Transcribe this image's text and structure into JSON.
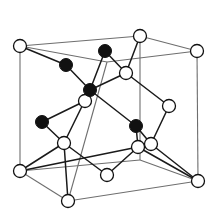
{
  "figure": {
    "background_color": "#ffffff",
    "width": 216,
    "height": 219
  },
  "style": {
    "cell_edge_color": "#6e6e6e",
    "cell_edge_width": 1.1,
    "bond_color": "#1a1a1a",
    "bond_width": 1.5,
    "open_atom_fill": "#ffffff",
    "open_atom_stroke": "#111111",
    "filled_atom_fill": "#111111",
    "open_atom_radius": 6.5,
    "filled_atom_radius": 6.5
  },
  "chart_data": {
    "type": "scatter",
    "xlabel": "",
    "ylabel": "",
    "grid": false,
    "legend": [
      {
        "marker": "open-circle",
        "label": "anion site"
      },
      {
        "marker": "filled-circle",
        "label": "cation site"
      }
    ],
    "cell_vertices": {
      "top_front_left": [
        20,
        46
      ],
      "top_back_left": [
        140,
        36
      ],
      "top_back_right": [
        197,
        51
      ],
      "top_front_right": [
        107,
        62
      ],
      "bottom_front_left": [
        20,
        171
      ],
      "bottom_back_left": [
        140,
        160
      ],
      "bottom_back_right": [
        198,
        181
      ],
      "bottom_front_right": [
        68,
        201
      ]
    },
    "cell_edges": [
      [
        "top_front_left",
        "top_back_left"
      ],
      [
        "top_back_left",
        "top_back_right"
      ],
      [
        "top_back_right",
        "top_front_right"
      ],
      [
        "top_front_right",
        "top_front_left"
      ],
      [
        "bottom_front_left",
        "bottom_back_left"
      ],
      [
        "bottom_back_left",
        "bottom_back_right"
      ],
      [
        "bottom_back_right",
        "bottom_front_right"
      ],
      [
        "bottom_front_right",
        "bottom_front_left"
      ],
      [
        "top_front_left",
        "bottom_front_left"
      ],
      [
        "top_back_left",
        "bottom_back_left"
      ],
      [
        "top_back_right",
        "bottom_back_right"
      ],
      [
        "top_front_right",
        "bottom_front_right"
      ]
    ],
    "atoms": [
      {
        "id": "a1",
        "x": 20,
        "y": 46,
        "type": "open"
      },
      {
        "id": "a2",
        "x": 140,
        "y": 36,
        "type": "open"
      },
      {
        "id": "a3",
        "x": 197,
        "y": 51,
        "type": "open"
      },
      {
        "id": "a4",
        "x": 20,
        "y": 171,
        "type": "open"
      },
      {
        "id": "a5",
        "x": 198,
        "y": 181,
        "type": "open"
      },
      {
        "id": "a6",
        "x": 68,
        "y": 201,
        "type": "open"
      },
      {
        "id": "a7",
        "x": 107,
        "y": 175,
        "type": "open"
      },
      {
        "id": "a8",
        "x": 126,
        "y": 73,
        "type": "open"
      },
      {
        "id": "a9",
        "x": 169,
        "y": 106,
        "type": "open"
      },
      {
        "id": "a10",
        "x": 85,
        "y": 101,
        "type": "open"
      },
      {
        "id": "a11",
        "x": 64,
        "y": 143,
        "type": "open"
      },
      {
        "id": "a12",
        "x": 138,
        "y": 147,
        "type": "open"
      },
      {
        "id": "a13",
        "x": 151,
        "y": 144,
        "type": "open"
      },
      {
        "id": "b1",
        "x": 66,
        "y": 65,
        "type": "filled"
      },
      {
        "id": "b2",
        "x": 105,
        "y": 51,
        "type": "filled"
      },
      {
        "id": "b3",
        "x": 90,
        "y": 90,
        "type": "filled"
      },
      {
        "id": "b4",
        "x": 42,
        "y": 122,
        "type": "filled"
      },
      {
        "id": "b5",
        "x": 136,
        "y": 126,
        "type": "filled"
      }
    ],
    "bonds": [
      [
        "a1",
        "b1"
      ],
      [
        "b1",
        "b3"
      ],
      [
        "b2",
        "b3"
      ],
      [
        "b2",
        "a8"
      ],
      [
        "a8",
        "a2"
      ],
      [
        "a8",
        "b3"
      ],
      [
        "a8",
        "a9"
      ],
      [
        "b3",
        "a10"
      ],
      [
        "b3",
        "b5"
      ],
      [
        "b3",
        "a11"
      ],
      [
        "b4",
        "a11"
      ],
      [
        "b4",
        "a10"
      ],
      [
        "a11",
        "a6"
      ],
      [
        "a11",
        "a7"
      ],
      [
        "b5",
        "a12"
      ],
      [
        "b5",
        "a13"
      ],
      [
        "a9",
        "a13"
      ],
      [
        "a12",
        "a7"
      ],
      [
        "a12",
        "a5"
      ],
      [
        "a13",
        "a5"
      ],
      [
        "a12",
        "a4"
      ],
      [
        "a11",
        "a4"
      ]
    ]
  }
}
